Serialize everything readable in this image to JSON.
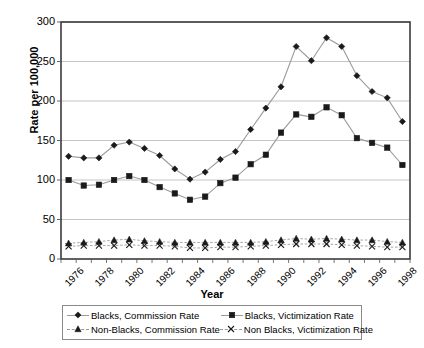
{
  "chart_data": {
    "type": "line",
    "title": "",
    "xlabel": "Year",
    "ylabel": "Rate per 100,000",
    "ylim": [
      0,
      300
    ],
    "ytick_step": 50,
    "yticks": [
      0,
      50,
      100,
      150,
      200,
      250,
      300
    ],
    "grid": "horizontal",
    "legend_position": "bottom",
    "x": [
      1976,
      1977,
      1978,
      1979,
      1980,
      1981,
      1982,
      1983,
      1984,
      1985,
      1986,
      1987,
      1988,
      1989,
      1990,
      1991,
      1992,
      1993,
      1994,
      1995,
      1996,
      1997,
      1998
    ],
    "xtick_labels": [
      "1976",
      "1978",
      "1980",
      "1982",
      "1984",
      "1986",
      "1988",
      "1990",
      "1992",
      "1994",
      "1996",
      "1998"
    ],
    "xtick_years": [
      1976,
      1978,
      1980,
      1982,
      1984,
      1986,
      1988,
      1990,
      1992,
      1994,
      1996,
      1998
    ],
    "series": [
      {
        "name": "Blacks, Commission Rate",
        "marker": "diamond",
        "color": "#1a1a1a",
        "line_color": "#9a9a9a",
        "values": [
          130,
          128,
          128,
          144,
          148,
          140,
          131,
          114,
          101,
          110,
          126,
          136,
          164,
          191,
          218,
          269,
          251,
          280,
          269,
          232,
          212,
          204,
          174
        ]
      },
      {
        "name": "Blacks, Victimization Rate",
        "marker": "square",
        "color": "#1a1a1a",
        "line_color": "#9a9a9a",
        "values": [
          100,
          93,
          94,
          100,
          105,
          100,
          91,
          83,
          75,
          79,
          96,
          103,
          120,
          132,
          160,
          183,
          180,
          192,
          182,
          153,
          147,
          141,
          119
        ]
      },
      {
        "name": "Non-Blacks, Commission Rate",
        "marker": "triangle",
        "color": "#1a1a1a",
        "line_color": "#9a9a9a",
        "values": [
          20,
          21,
          22,
          24,
          25,
          23,
          22,
          21,
          21,
          21,
          21,
          21,
          21,
          22,
          24,
          26,
          25,
          26,
          25,
          24,
          24,
          22,
          21
        ]
      },
      {
        "name": "Non Blacks, Victimization Rate",
        "marker": "x",
        "color": "#1a1a1a",
        "line_color": "#9a9a9a",
        "values": [
          16,
          17,
          17,
          17,
          18,
          17,
          17,
          16,
          14,
          14,
          15,
          15,
          16,
          17,
          18,
          19,
          19,
          19,
          18,
          17,
          16,
          15,
          15
        ]
      }
    ]
  },
  "axes": {
    "y_title": "Rate per 100,000",
    "x_title": "Year"
  },
  "legend": {
    "entries": [
      {
        "label": "Blacks, Commission Rate",
        "marker": "diamond",
        "dashed": false
      },
      {
        "label": "Blacks, Victimization Rate",
        "marker": "square",
        "dashed": false
      },
      {
        "label": "Non-Blacks, Commission Rate",
        "marker": "triangle",
        "dashed": true
      },
      {
        "label": "Non Blacks, Victimization Rate",
        "marker": "x",
        "dashed": true
      }
    ]
  },
  "colors": {
    "frame": "#3b3b3b",
    "grid": "#b5b5b5",
    "marker": "#1a1a1a",
    "line": "#9a9a9a",
    "text": "#000000",
    "background": "#ffffff"
  }
}
